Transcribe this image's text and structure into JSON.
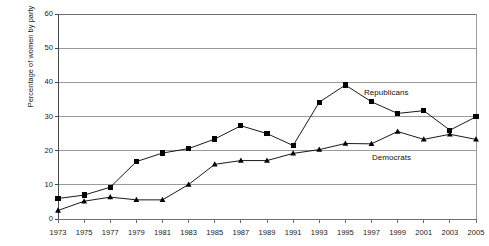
{
  "chart_data": {
    "type": "line",
    "title": "",
    "xlabel": "",
    "ylabel": "Percentage of women by party",
    "ylim": [
      0,
      60
    ],
    "ytick_values": [
      0,
      10,
      20,
      30,
      40,
      50,
      60
    ],
    "ytick_labels": [
      "0",
      "10",
      "20",
      "30",
      "40",
      "50",
      "60"
    ],
    "grid": "horizontal",
    "legend_position": "inline-annotation",
    "categories": [
      1973,
      1975,
      1977,
      1979,
      1981,
      1983,
      1985,
      1987,
      1989,
      1991,
      1993,
      1995,
      1997,
      1999,
      2001,
      2003,
      2005
    ],
    "xtick_labels": [
      "1973",
      "1975",
      "1977",
      "1979",
      "1981",
      "1983",
      "1985",
      "1987",
      "1989",
      "1991",
      "1993",
      "1995",
      "1997",
      "1999",
      "2001",
      "2003",
      "2005"
    ],
    "series": [
      {
        "name": "Republicans",
        "marker": "square",
        "color": "#000000",
        "values": [
          6.0,
          7.0,
          9.3,
          16.8,
          19.3,
          20.6,
          23.4,
          27.3,
          25.0,
          21.5,
          34.2,
          39.2,
          34.3,
          30.9,
          31.7,
          26.0,
          29.9
        ]
      },
      {
        "name": "Democrats",
        "marker": "triangle",
        "color": "#000000",
        "values": [
          2.5,
          5.2,
          6.4,
          5.6,
          5.6,
          10.1,
          16.0,
          17.1,
          17.1,
          19.2,
          20.3,
          22.1,
          22.0,
          25.6,
          23.3,
          24.8,
          23.3
        ]
      }
    ],
    "annotations": [
      {
        "text": "Republicans",
        "series": "Republicans",
        "x_px": 364,
        "y_px": 88
      },
      {
        "text": "Democrats",
        "series": "Democrats",
        "x_px": 372,
        "y_px": 153
      }
    ]
  },
  "figure": {
    "faint_header_text": ""
  }
}
